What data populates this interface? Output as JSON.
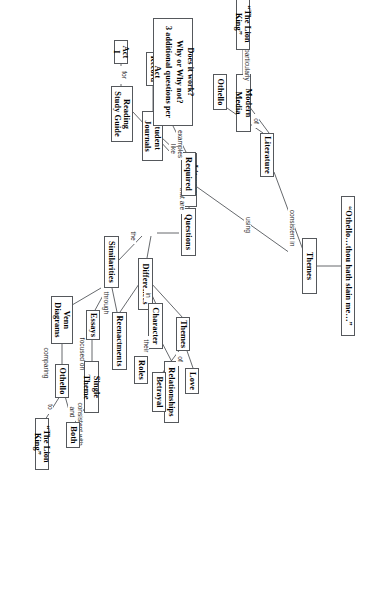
{
  "diagram": {
    "type": "concept-map",
    "orientation": "rotated-90-clockwise",
    "nodes": {
      "quote": "“Othello…thou hath slain me…”",
      "themes_root": "Themes",
      "literature": "Literature",
      "modern_media": "Modern Media",
      "lion_king_top": "“The Lion King”",
      "othello_top": "Othello",
      "literary_tools": "Literary Tools",
      "student_journals": "Student Journals",
      "reading_study_guide": "Reading Study Guide",
      "act_i": "Act I",
      "record": "Record",
      "questions": "Questions",
      "required": "Required",
      "note": "Does it work?\nWhy or Why not?\n3 additional questions per Act",
      "differences": "Differences",
      "character": "Character",
      "roles": "Roles",
      "relationships": "Relationships",
      "themes_sub": "Themes",
      "love": "Love",
      "betrayal": "Betrayal",
      "reenactments": "Reenactments",
      "similarities": "Similarities",
      "essays": "Essays",
      "single_theme": "Single Theme",
      "both": "Both",
      "venn_diagrams": "Venn Diagrams",
      "othello_bottom": "Othello",
      "lion_king_bottom": "“The Lion King”"
    },
    "link_labels": {
      "consistent_in": "consistent in",
      "of_literature": "of",
      "particularly": "particularly",
      "using": "using",
      "like": "like",
      "for": "for",
      "to_record": "to",
      "the": "the",
      "that_are": "that are",
      "examples": "examples",
      "in": "in",
      "their": "their",
      "of_themes": "of",
      "through": "through",
      "focused_on": "focused on",
      "consistent_with": "consistent with",
      "comparing": "comparing",
      "to_compare": "to",
      "and": "and"
    },
    "colors": {
      "border": "#55585c",
      "text": "#000000",
      "link_text": "#2b2b2b",
      "background": "#ffffff"
    }
  }
}
